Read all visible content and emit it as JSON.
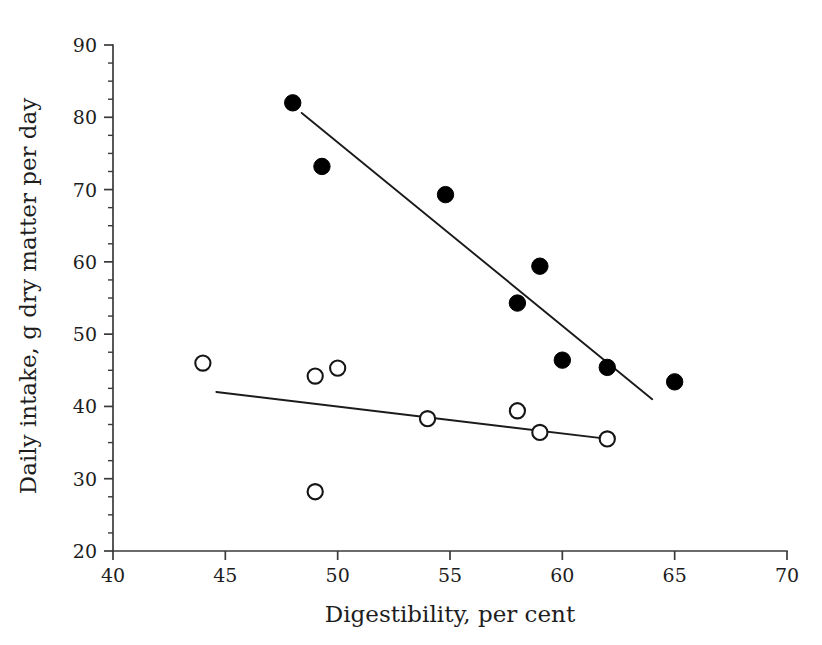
{
  "chart_data": {
    "type": "scatter",
    "title": "",
    "xlabel": "Digestibility, per cent",
    "ylabel": "Daily intake, g dry matter per day",
    "xlim": [
      40,
      70
    ],
    "ylim": [
      20,
      90
    ],
    "x_ticks": [
      40,
      45,
      50,
      55,
      60,
      65,
      70
    ],
    "x_tick_labels": [
      "40",
      "45",
      "50",
      "55",
      "60",
      "65",
      "70"
    ],
    "y_ticks": [
      20,
      30,
      40,
      50,
      60,
      70,
      80,
      90
    ],
    "y_tick_labels": [
      "20",
      "30",
      "40",
      "50",
      "60",
      "70",
      "80",
      "90"
    ],
    "x_minor_step": 2.5,
    "y_minor_step": 2.5,
    "grid": false,
    "legend": "none",
    "series": [
      {
        "name": "filled-circles",
        "marker": "filled-circle",
        "color": "#000000",
        "points": [
          {
            "x": 48.0,
            "y": 82.0
          },
          {
            "x": 49.3,
            "y": 73.2
          },
          {
            "x": 54.8,
            "y": 69.3
          },
          {
            "x": 58.0,
            "y": 54.3
          },
          {
            "x": 59.0,
            "y": 59.4
          },
          {
            "x": 60.0,
            "y": 46.4
          },
          {
            "x": 62.0,
            "y": 45.4
          },
          {
            "x": 65.0,
            "y": 43.4
          }
        ],
        "fit_line": {
          "x1": 48.4,
          "y1": 80.6,
          "x2": 64.0,
          "y2": 41.0
        }
      },
      {
        "name": "open-circles",
        "marker": "open-circle",
        "color": "#151515",
        "points": [
          {
            "x": 44.0,
            "y": 46.0
          },
          {
            "x": 49.0,
            "y": 44.2
          },
          {
            "x": 50.0,
            "y": 45.3
          },
          {
            "x": 49.0,
            "y": 28.2
          },
          {
            "x": 54.0,
            "y": 38.3
          },
          {
            "x": 58.0,
            "y": 39.4
          },
          {
            "x": 59.0,
            "y": 36.4
          },
          {
            "x": 62.0,
            "y": 35.5
          }
        ],
        "fit_line": {
          "x1": 44.6,
          "y1": 42.0,
          "x2": 62.3,
          "y2": 35.4
        }
      }
    ]
  },
  "axes": {
    "x_title": "Digestibility, per cent",
    "y_title": "Daily intake, g dry matter per day"
  },
  "x_labels": [
    "40",
    "45",
    "50",
    "55",
    "60",
    "65",
    "70"
  ],
  "y_labels": [
    "90",
    "80",
    "70",
    "60",
    "50",
    "40",
    "30",
    "20"
  ]
}
